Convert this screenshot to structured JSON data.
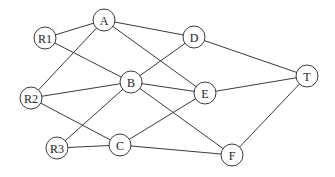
{
  "diagram": {
    "type": "undirected-graph",
    "width": 335,
    "height": 177,
    "node_radius": 11,
    "colors": {
      "stroke": "#3a3a3a",
      "fill": "#ffffff",
      "text": "#222222"
    },
    "nodes": [
      {
        "id": "A",
        "label": "A",
        "x": 104,
        "y": 20
      },
      {
        "id": "R1",
        "label": "R1",
        "x": 45,
        "y": 38
      },
      {
        "id": "D",
        "label": "D",
        "x": 194,
        "y": 37
      },
      {
        "id": "B",
        "label": "B",
        "x": 131,
        "y": 82
      },
      {
        "id": "R2",
        "label": "R2",
        "x": 31,
        "y": 98
      },
      {
        "id": "E",
        "label": "E",
        "x": 205,
        "y": 93
      },
      {
        "id": "T",
        "label": "T",
        "x": 307,
        "y": 76
      },
      {
        "id": "R3",
        "label": "R3",
        "x": 57,
        "y": 148
      },
      {
        "id": "C",
        "label": "C",
        "x": 120,
        "y": 145
      },
      {
        "id": "F",
        "label": "F",
        "x": 232,
        "y": 155
      }
    ],
    "edges": [
      {
        "from": "R1",
        "to": "A"
      },
      {
        "from": "A",
        "to": "D"
      },
      {
        "from": "A",
        "to": "R2"
      },
      {
        "from": "A",
        "to": "E"
      },
      {
        "from": "R1",
        "to": "B"
      },
      {
        "from": "B",
        "to": "D"
      },
      {
        "from": "B",
        "to": "E"
      },
      {
        "from": "B",
        "to": "F"
      },
      {
        "from": "R2",
        "to": "B"
      },
      {
        "from": "R3",
        "to": "B"
      },
      {
        "from": "D",
        "to": "T"
      },
      {
        "from": "E",
        "to": "T"
      },
      {
        "from": "R2",
        "to": "C"
      },
      {
        "from": "R3",
        "to": "C"
      },
      {
        "from": "C",
        "to": "E"
      },
      {
        "from": "C",
        "to": "F"
      },
      {
        "from": "F",
        "to": "T"
      }
    ]
  }
}
